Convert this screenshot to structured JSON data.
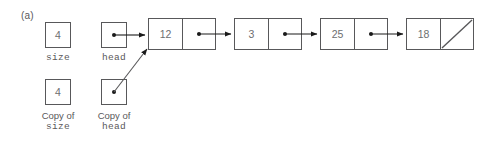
{
  "figure": {
    "label": "(a)",
    "background": "#ffffff",
    "stroke_color": "#58585a",
    "text_color": "#6d6e70",
    "arrow_color": "#1a1a1a"
  },
  "variables": [
    {
      "name": "size",
      "value": "4",
      "caption_top": "",
      "caption_mono": "size",
      "kind": "value-box"
    },
    {
      "name": "head",
      "value": "",
      "caption_top": "",
      "caption_mono": "head",
      "kind": "pointer-box"
    },
    {
      "name": "copy-of-size",
      "value": "4",
      "caption_top": "Copy of",
      "caption_mono": "size",
      "kind": "value-box"
    },
    {
      "name": "copy-of-head",
      "value": "",
      "caption_top": "Copy of",
      "caption_mono": "head",
      "kind": "pointer-box"
    }
  ],
  "list": {
    "nodes": [
      {
        "data": "12",
        "next": "pointer"
      },
      {
        "data": "3",
        "next": "pointer"
      },
      {
        "data": "25",
        "next": "pointer"
      },
      {
        "data": "18",
        "next": "null"
      }
    ]
  },
  "arrows": [
    {
      "name": "head-to-node-12",
      "from": "head",
      "to": "node-12"
    },
    {
      "name": "copy-of-head-to-node-12",
      "from": "copy-of-head",
      "to": "node-12"
    },
    {
      "name": "node-12-to-node-3",
      "from": "node-12",
      "to": "node-3"
    },
    {
      "name": "node-3-to-node-25",
      "from": "node-3",
      "to": "node-25"
    },
    {
      "name": "node-25-to-node-18",
      "from": "node-25",
      "to": "node-18"
    }
  ]
}
